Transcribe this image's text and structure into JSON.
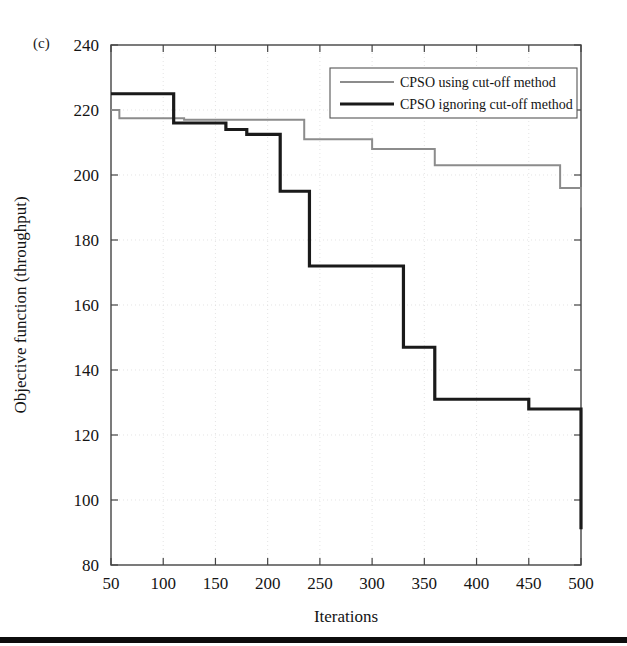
{
  "figure": {
    "panel_label": "(c)",
    "background_color": "#ffffff",
    "bottom_rule_color": "#0d0d0d"
  },
  "chart_data": {
    "type": "line",
    "title": "",
    "subtitle": "",
    "xlabel": "Iterations",
    "ylabel": "Objective function (throughput)",
    "xlim": [
      50,
      500
    ],
    "ylim": [
      80,
      240
    ],
    "xticks": [
      50,
      100,
      150,
      200,
      250,
      300,
      350,
      400,
      450,
      500
    ],
    "yticks": [
      80,
      100,
      120,
      140,
      160,
      180,
      200,
      220,
      240
    ],
    "xtick_labels": [
      "50",
      "100",
      "150",
      "200",
      "250",
      "300",
      "350",
      "400",
      "450",
      "500"
    ],
    "ytick_labels": [
      "80",
      "100",
      "120",
      "140",
      "160",
      "180",
      "200",
      "220",
      "240"
    ],
    "grid": true,
    "legend_position": "top-right",
    "step_style": "post",
    "series": [
      {
        "name": "CPSO using cut-off method",
        "color": "#8c8c8c",
        "width": 2.0,
        "x": [
          50,
          55,
          58,
          90,
          120,
          180,
          235,
          260,
          300,
          360,
          480,
          500
        ],
        "values": [
          220.0,
          220.0,
          217.5,
          217.5,
          217.0,
          217.0,
          211.0,
          211.0,
          208.0,
          203.0,
          196.0,
          190.0
        ]
      },
      {
        "name": "CPSO ignoring cut-off method",
        "color": "#1a1a1a",
        "width": 3.2,
        "x": [
          50,
          90,
          110,
          130,
          160,
          180,
          212,
          240,
          330,
          360,
          450,
          500
        ],
        "values": [
          225.0,
          225.0,
          216.0,
          216.0,
          214.0,
          212.5,
          195.0,
          172.0,
          147.0,
          131.0,
          128.0,
          91.0
        ]
      }
    ]
  },
  "legend": {
    "entries": [
      {
        "label": "CPSO using cut-off method",
        "color": "#8c8c8c",
        "width": 2.0
      },
      {
        "label": "CPSO ignoring cut-off method",
        "color": "#1a1a1a",
        "width": 3.2
      }
    ]
  }
}
